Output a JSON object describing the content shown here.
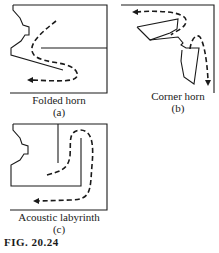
{
  "figure": {
    "number": "FIG. 20.24",
    "panels": [
      {
        "id": "a",
        "title": "Folded horn",
        "label": "(a)"
      },
      {
        "id": "b",
        "title": "Corner horn",
        "label": "(b)"
      },
      {
        "id": "c",
        "title": "Acoustic labyrinth",
        "label": "(c)"
      }
    ]
  },
  "colors": {
    "line": "#1a1a1a",
    "background": "#ffffff"
  }
}
